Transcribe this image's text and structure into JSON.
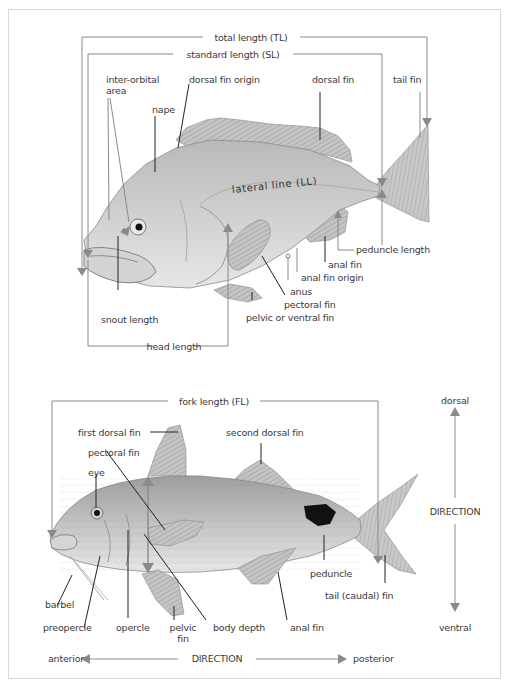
{
  "figure": {
    "type": "fish-anatomy-diagram",
    "colors": {
      "frame_border": "#d9d9d9",
      "leader_gray": "#8a8a8a",
      "leader_dark": "#222222",
      "label_text": "#3a3a3a",
      "fish_body": "#c9c9c9",
      "fin": "#b8b8b8",
      "peduncle_spot": "#111111"
    }
  },
  "top_fish": {
    "measurements": {
      "total_length": "total length (TL)",
      "standard_length": "standard length (SL)",
      "head_length": "head length",
      "snout_length": "snout length",
      "peduncle_length": "peduncle length"
    },
    "labels": {
      "inter_orbital_line1": "inter-orbital",
      "inter_orbital_line2": "area",
      "nape": "nape",
      "dorsal_fin_origin": "dorsal fin origin",
      "dorsal_fin": "dorsal fin",
      "tail_fin": "tail fin",
      "lateral_line": "lateral line (LL)",
      "anal_fin": "anal fin",
      "anal_fin_origin": "anal fin origin",
      "anus": "anus",
      "pectoral_fin": "pectoral fin",
      "pelvic_fin": "pelvic or ventral fin"
    }
  },
  "bottom_fish": {
    "measurements": {
      "fork_length": "fork length (FL)",
      "body_depth": "body depth"
    },
    "labels": {
      "first_dorsal_fin": "first dorsal fin",
      "second_dorsal_fin": "second dorsal fin",
      "pectoral_fin": "pectoral fin",
      "eye": "eye",
      "barbel": "barbel",
      "preopercle": "preopercle",
      "opercle": "opercle",
      "pelvic_fin_line1": "pelvic",
      "pelvic_fin_line2": "fin",
      "anal_fin": "anal fin",
      "peduncle": "peduncle",
      "tail_fin": "tail (caudal) fin"
    }
  },
  "direction_axes": {
    "vertical": {
      "top": "dorsal",
      "middle": "DIRECTION",
      "bottom": "ventral"
    },
    "horizontal": {
      "left": "anterior",
      "middle": "DIRECTION",
      "right": "posterior"
    }
  }
}
